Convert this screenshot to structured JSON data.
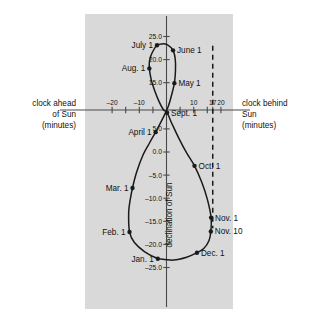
{
  "figure": {
    "panel_bg": "#d9d9d9",
    "curve_color": "#1a1a1a",
    "axis_color": "#4a4a4a",
    "x_axis": {
      "left_label_lines": [
        "clock ahead",
        "of Sun",
        "(minutes)"
      ],
      "right_label_lines": [
        "clock behind",
        "Sun",
        "(minutes)"
      ],
      "ticks": [
        -20,
        -15,
        -10,
        -5,
        5,
        10,
        15,
        17,
        20
      ],
      "tick_labels": [
        {
          "value": -20,
          "text": "–20"
        },
        {
          "value": -10,
          "text": "–10"
        },
        {
          "value": 10,
          "text": "10"
        },
        {
          "value": 17,
          "text": "17"
        },
        {
          "value": 20,
          "text": "20"
        }
      ],
      "range": [
        -24,
        24
      ]
    },
    "y_axis": {
      "label": "declination of Sun",
      "tick_labels": [
        {
          "value": 25,
          "text": "25.0"
        },
        {
          "value": 20,
          "text": "20.0"
        },
        {
          "value": 15,
          "text": "15.0"
        },
        {
          "value": 5,
          "text": "5.0"
        },
        {
          "value": 0,
          "text": "0.0"
        },
        {
          "value": -5,
          "text": "–5.0"
        },
        {
          "value": -10,
          "text": "–10.0"
        },
        {
          "value": -15,
          "text": "–15.0"
        },
        {
          "value": -20,
          "text": "–20.0"
        },
        {
          "value": -25,
          "text": "–25.0"
        }
      ],
      "range": [
        -26.5,
        26.5
      ]
    },
    "dashed_line": {
      "x_value": 17,
      "from_y": 23.0,
      "to_y": -16.5
    }
  },
  "chart_data": {
    "type": "scatter",
    "title": "",
    "xlabel": "clock ahead of Sun / clock behind Sun (minutes)",
    "ylabel": "declination of Sun",
    "xlim": [
      -24,
      24
    ],
    "ylim": [
      -26.5,
      26.5
    ],
    "grid": false,
    "legend": "none",
    "series": [
      {
        "name": "analemma",
        "points": [
          {
            "label": "Jan. 1",
            "x": -3.2,
            "y": -23.1,
            "anchor": "right"
          },
          {
            "label": "Feb. 1",
            "x": -13.6,
            "y": -17.3,
            "anchor": "right"
          },
          {
            "label": "Mar. 1",
            "x": -12.5,
            "y": -7.8,
            "anchor": "right"
          },
          {
            "label": "April 1",
            "x": -4.0,
            "y": 4.3,
            "anchor": "right"
          },
          {
            "label": "May 1",
            "x": 2.9,
            "y": 14.9,
            "anchor": "left"
          },
          {
            "label": "June 1",
            "x": 2.4,
            "y": 22.0,
            "anchor": "left"
          },
          {
            "label": "July 1",
            "x": -3.5,
            "y": 23.1,
            "anchor": "right"
          },
          {
            "label": "Aug. 1",
            "x": -6.3,
            "y": 18.1,
            "anchor": "right"
          },
          {
            "label": "Sept. 1",
            "x": 0.2,
            "y": 8.5,
            "anchor": "left"
          },
          {
            "label": "Oct. 1",
            "x": 10.3,
            "y": -3.0,
            "anchor": "left"
          },
          {
            "label": "Nov. 1",
            "x": 16.4,
            "y": -14.2,
            "anchor": "left"
          },
          {
            "label": "Nov. 10",
            "x": 16.3,
            "y": -17.2,
            "anchor": "left"
          },
          {
            "label": "Dec. 1",
            "x": 11.2,
            "y": -21.8,
            "anchor": "left"
          }
        ]
      }
    ]
  }
}
